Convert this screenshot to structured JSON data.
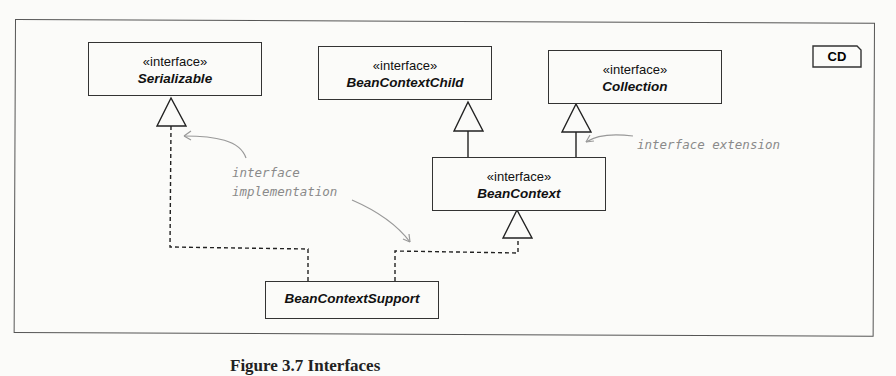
{
  "diagram": {
    "frame_tag": "CD",
    "classes": [
      {
        "id": "serializable",
        "stereotype": "«interface»",
        "name": "Serializable"
      },
      {
        "id": "beancontextchild",
        "stereotype": "«interface»",
        "name": "BeanContextChild"
      },
      {
        "id": "collection",
        "stereotype": "«interface»",
        "name": "Collection"
      },
      {
        "id": "beancontext",
        "stereotype": "«interface»",
        "name": "BeanContext"
      },
      {
        "id": "beancontextsupport",
        "stereotype": "",
        "name": "BeanContextSupport"
      }
    ],
    "relationships": [
      {
        "from": "BeanContext",
        "to": "BeanContextChild",
        "type": "generalization"
      },
      {
        "from": "BeanContext",
        "to": "Collection",
        "type": "generalization"
      },
      {
        "from": "BeanContextSupport",
        "to": "Serializable",
        "type": "realization"
      },
      {
        "from": "BeanContextSupport",
        "to": "BeanContext",
        "type": "realization"
      }
    ],
    "notes": {
      "implementation_line1": "interface",
      "implementation_line2": "implementation",
      "extension": "interface extension"
    }
  },
  "caption": "Figure 3.7 Interfaces"
}
